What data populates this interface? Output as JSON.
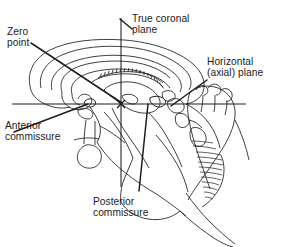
{
  "figure": {
    "background_color": "#ffffff",
    "ink_color": "#1d1d1d",
    "width": 292,
    "height": 247
  },
  "labels": {
    "zero_point": "Zero\npoint",
    "true_coronal_plane": "True coronal\nplane",
    "horizontal_axial_plane": "Horizontal\n(axial) plane",
    "anterior_commissure": "Anterior\ncommissure",
    "posterior_commissure": "Posterior\ncommissure"
  },
  "diagram_elements": {
    "reference_lines": [
      {
        "name": "horizontal-axial-plane-line",
        "orientation": "horizontal",
        "x1": 12,
        "y1": 104,
        "x2": 246,
        "y2": 104
      },
      {
        "name": "true-coronal-plane-line",
        "orientation": "vertical",
        "x1": 121,
        "y1": 18,
        "x2": 121,
        "y2": 187
      }
    ],
    "zero_point_marker": {
      "x": 121,
      "y": 104
    },
    "leader_lines": [
      {
        "name": "zero-point-leader",
        "x1": 31,
        "y1": 43,
        "x2": 122,
        "y2": 103
      },
      {
        "name": "true-coronal-leader",
        "x1": 131,
        "y1": 28,
        "x2": 120,
        "y2": 19
      },
      {
        "name": "horizontal-axial-leader",
        "x1": 206,
        "y1": 81,
        "x2": 172,
        "y2": 106
      },
      {
        "name": "anterior-commissure-leader",
        "x1": 14,
        "y1": 132,
        "x2": 87,
        "y2": 105
      },
      {
        "name": "posterior-commissure-leader",
        "x1": 139,
        "y1": 190,
        "x2": 148,
        "y2": 104
      }
    ],
    "anatomy": [
      "cerebral-hemisphere-outline",
      "corpus-callosum",
      "cingulate-gyrus",
      "lateral-ventricle",
      "thalamus",
      "fornix-choroid-plexus-hatching",
      "anterior-commissure",
      "posterior-commissure",
      "hypothalamus",
      "pituitary-stalk",
      "pituitary-gland",
      "midbrain",
      "pons",
      "medulla",
      "cerebellum-with-folia",
      "fourth-ventricle",
      "tentorium"
    ]
  }
}
